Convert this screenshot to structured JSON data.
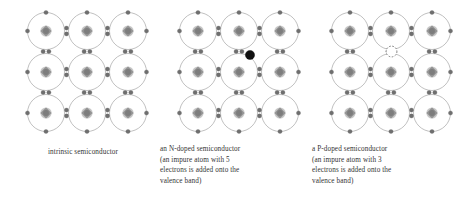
{
  "figure": {
    "background_color": "#ffffff",
    "width": 462,
    "height": 203
  },
  "style": {
    "ring_stroke": "#b0b0b0",
    "nucleus_color": "#8a8a8a",
    "electron_color": "#6f6f6f",
    "dopant_electron_color": "#111111",
    "hole_stroke": "#6d6d6d",
    "text_color": "#333333"
  },
  "panels": [
    {
      "id": "intrinsic",
      "name": "intrinsic-semiconductor-panel",
      "x": 8,
      "lattice": {
        "rows": 3,
        "cols": 3,
        "origin_x": 38,
        "origin_y": 31,
        "spacing_x": 41,
        "spacing_y": 41,
        "ring_radius": 18.5,
        "electron_radius": 2.1,
        "nucleus_radius": 5.6
      },
      "dopant": null,
      "hole": null,
      "caption": {
        "align": "center",
        "top": 147,
        "lines": [
          "intrinsic semiconductor"
        ]
      }
    },
    {
      "id": "n-doped",
      "name": "n-doped-semiconductor-panel",
      "x": 160,
      "lattice": {
        "rows": 3,
        "cols": 3,
        "origin_x": 38,
        "origin_y": 31,
        "spacing_x": 41,
        "spacing_y": 41,
        "ring_radius": 18.5,
        "electron_radius": 2.1,
        "nucleus_radius": 5.6
      },
      "dopant": {
        "label": "extra-electron",
        "cx": 90,
        "cy": 55,
        "r": 4.6,
        "color": "#111111"
      },
      "hole": null,
      "caption": {
        "align": "left",
        "top": 144,
        "lines": [
          "an N-doped semiconductor",
          "(an impure atom with 5",
          "electrons is added onto the",
          "valence band)"
        ]
      }
    },
    {
      "id": "p-doped",
      "name": "p-doped-semiconductor-panel",
      "x": 312,
      "lattice": {
        "rows": 3,
        "cols": 3,
        "origin_x": 38,
        "origin_y": 31,
        "spacing_x": 41,
        "spacing_y": 41,
        "ring_radius": 18.5,
        "electron_radius": 2.1,
        "nucleus_radius": 5.6
      },
      "dopant": null,
      "hole": {
        "label": "electron-hole",
        "cx": 79.5,
        "cy": 51.5,
        "r": 5.4,
        "stroke": "#6d6d6d"
      },
      "caption": {
        "align": "left",
        "top": 144,
        "lines": [
          "a P-doped semiconductor",
          "(an impure atom with 3",
          "electrons is added onto the",
          "valence band)"
        ]
      }
    }
  ]
}
